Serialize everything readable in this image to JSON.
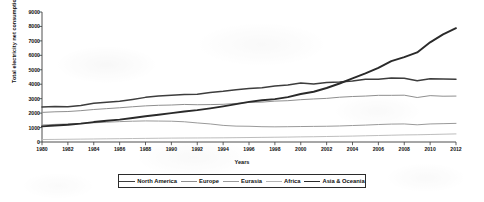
{
  "chart_data": {
    "type": "line",
    "title": "",
    "xlabel": "Years",
    "ylabel": "Total electricity net consumption (Billion KWh)",
    "xlim": [
      1980,
      2012
    ],
    "ylim": [
      0,
      9000
    ],
    "ytick_step": 1000,
    "grid": false,
    "legend_position": "bottom",
    "xticks": [
      "1980",
      "1982",
      "1984",
      "1986",
      "1988",
      "1990",
      "1992",
      "1994",
      "1996",
      "1998",
      "2000",
      "2002",
      "2004",
      "2006",
      "2008",
      "2010",
      "2012"
    ],
    "yticks": [
      "0",
      "1000",
      "2000",
      "3000",
      "4000",
      "5000",
      "6000",
      "7000",
      "8000",
      "9000"
    ],
    "x": [
      1980,
      1981,
      1982,
      1983,
      1984,
      1985,
      1986,
      1987,
      1988,
      1989,
      1990,
      1991,
      1992,
      1993,
      1994,
      1995,
      1996,
      1997,
      1998,
      1999,
      2000,
      2001,
      2002,
      2003,
      2004,
      2005,
      2006,
      2007,
      2008,
      2009,
      2010,
      2011,
      2012
    ],
    "series": [
      {
        "name": "North America",
        "color": "#3d3d3d",
        "width": 1.5,
        "values": [
          2420,
          2460,
          2440,
          2530,
          2680,
          2760,
          2820,
          2950,
          3090,
          3190,
          3240,
          3290,
          3300,
          3420,
          3510,
          3620,
          3700,
          3750,
          3870,
          3950,
          4080,
          4010,
          4120,
          4150,
          4230,
          4340,
          4340,
          4430,
          4410,
          4240,
          4380,
          4360,
          4350
        ]
      },
      {
        "name": "Europe",
        "color": "#8f8f8f",
        "width": 1.0,
        "values": [
          2050,
          2090,
          2110,
          2170,
          2250,
          2310,
          2370,
          2440,
          2500,
          2540,
          2560,
          2600,
          2580,
          2590,
          2610,
          2670,
          2740,
          2760,
          2830,
          2860,
          2930,
          2980,
          3020,
          3100,
          3150,
          3180,
          3230,
          3230,
          3240,
          3080,
          3210,
          3170,
          3180
        ]
      },
      {
        "name": "Eurasia",
        "color": "#9a9a9a",
        "width": 1.0,
        "values": [
          1180,
          1220,
          1250,
          1290,
          1330,
          1370,
          1410,
          1440,
          1460,
          1450,
          1440,
          1400,
          1320,
          1250,
          1150,
          1100,
          1090,
          1060,
          1050,
          1060,
          1070,
          1080,
          1090,
          1110,
          1140,
          1170,
          1210,
          1240,
          1250,
          1190,
          1250,
          1270,
          1290
        ]
      },
      {
        "name": "Africa",
        "color": "#b5b5b5",
        "width": 0.9,
        "values": [
          170,
          180,
          190,
          200,
          210,
          220,
          230,
          240,
          250,
          260,
          270,
          275,
          280,
          285,
          290,
          300,
          310,
          320,
          330,
          340,
          355,
          365,
          380,
          395,
          410,
          430,
          450,
          470,
          490,
          500,
          520,
          540,
          560
        ]
      },
      {
        "name": "Asia & Oceania",
        "color": "#2a2a2a",
        "width": 1.9,
        "values": [
          1080,
          1140,
          1190,
          1270,
          1380,
          1470,
          1550,
          1660,
          1780,
          1890,
          2000,
          2110,
          2210,
          2330,
          2470,
          2620,
          2780,
          2890,
          2970,
          3110,
          3320,
          3480,
          3740,
          4050,
          4400,
          4750,
          5130,
          5600,
          5880,
          6200,
          6900,
          7450,
          7880
        ]
      }
    ]
  }
}
